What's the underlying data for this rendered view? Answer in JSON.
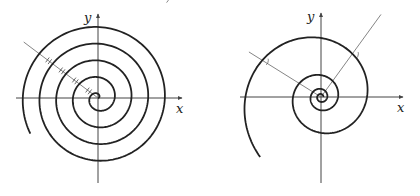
{
  "figures": [
    {
      "name": "archimedean-spiral",
      "origin": [
        98,
        98
      ],
      "x_axis": {
        "from": 16,
        "to": 182,
        "label": "x"
      },
      "y_axis": {
        "from": 183,
        "to": 14,
        "label": "y"
      },
      "spiral": {
        "type": "archimedean",
        "a_per_rad": 2.66,
        "theta_end_deg": 1650
      },
      "ray": {
        "angle_deg": 143,
        "length": 93,
        "tick_radii": [
          16.7,
          33.4,
          50.1,
          66.8
        ]
      }
    },
    {
      "name": "logarithmic-spiral",
      "origin": [
        321,
        97
      ],
      "x_axis": {
        "from": 240,
        "to": 403,
        "label": "x"
      },
      "y_axis": {
        "from": 183,
        "to": 13,
        "label": "y"
      },
      "spiral": {
        "type": "logarithmic",
        "r0": 46,
        "b": 0.158,
        "theta_start_deg": -1080,
        "theta_end_deg": 225
      },
      "rays": [
        {
          "angle_deg": 148,
          "length": 85
        },
        {
          "angle_deg": 54,
          "length": 102
        }
      ]
    }
  ],
  "colors": {
    "curve": "#222222",
    "axis": "#444444",
    "ray": "#666666"
  }
}
